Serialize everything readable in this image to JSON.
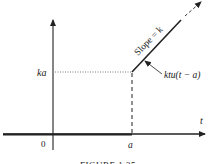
{
  "figure": {
    "labels": {
      "y_value": "ka",
      "origin": "0",
      "x_point": "a",
      "x_axis": "t",
      "slope": "Slope = k",
      "function": "ktu(t − a)"
    },
    "caption": "FIGURE 1.35"
  },
  "colors": {
    "ink": "#222222",
    "background": "#ffffff"
  }
}
